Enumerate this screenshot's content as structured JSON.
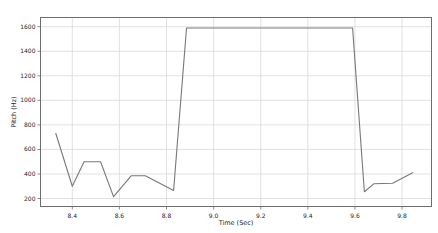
{
  "figure": {
    "width": 438,
    "height": 233,
    "background": "#ffffff"
  },
  "chart_data": {
    "type": "line",
    "title": "",
    "xlabel": "Time (Sec)",
    "ylabel": "Pitch (Hz)",
    "x_tick_labels": [
      "8.4",
      "8.6",
      "8.8",
      "9.0",
      "9.2",
      "9.4",
      "9.6",
      "9.8"
    ],
    "y_tick_labels": [
      "200",
      "400",
      "600",
      "800",
      "1000",
      "1200",
      "1400",
      "1600"
    ],
    "xlim": [
      8.265,
      9.925
    ],
    "ylim": [
      135,
      1675
    ],
    "grid": true,
    "legend": "none",
    "colors": {
      "line": "#787878",
      "grid": "#d9d9d9",
      "spine": "#6e6e6e",
      "tick_text": "#262626",
      "background": "#ffffff"
    },
    "series": [
      {
        "name": "pitch",
        "points": [
          [
            8.33,
            730
          ],
          [
            8.4,
            300
          ],
          [
            8.45,
            500
          ],
          [
            8.52,
            500
          ],
          [
            8.575,
            215
          ],
          [
            8.65,
            385
          ],
          [
            8.71,
            385
          ],
          [
            8.83,
            265
          ],
          [
            8.885,
            1590
          ],
          [
            9.59,
            1590
          ],
          [
            9.64,
            255
          ],
          [
            9.68,
            320
          ],
          [
            9.76,
            325
          ],
          [
            9.845,
            410
          ]
        ]
      }
    ]
  }
}
